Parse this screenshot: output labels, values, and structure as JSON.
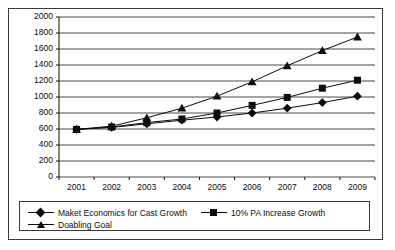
{
  "chart_data": {
    "type": "line",
    "title": "",
    "xlabel": "",
    "ylabel": "",
    "categories": [
      "2001",
      "2002",
      "2003",
      "2004",
      "2005",
      "2006",
      "2007",
      "2008",
      "2009"
    ],
    "ylim": [
      0,
      2000
    ],
    "ytick_step": 200,
    "yticks": [
      "2000",
      "1800",
      "1600",
      "1400",
      "1200",
      "1000",
      "800",
      "600",
      "400",
      "200",
      "0"
    ],
    "grid": true,
    "legend_position": "bottom",
    "series": [
      {
        "name": "Maket Economics for Cast Growth",
        "marker": "diamond",
        "color": "#0d0d0d",
        "values": [
          595,
          620,
          665,
          710,
          750,
          800,
          860,
          930,
          1010
        ]
      },
      {
        "name": "10% PA Increase Growth",
        "marker": "square",
        "color": "#0d0d0d",
        "values": [
          595,
          625,
          680,
          725,
          800,
          895,
          995,
          1110,
          1210
        ]
      },
      {
        "name": "Doabling Goal",
        "marker": "triangle",
        "color": "#0d0d0d",
        "values": [
          595,
          635,
          740,
          860,
          1010,
          1190,
          1390,
          1580,
          1750
        ]
      }
    ]
  },
  "legend": {
    "entries": [
      {
        "label": "Maket Economics for Cast Growth",
        "marker": "diamond"
      },
      {
        "label": "10% PA Increase Growth",
        "marker": "square"
      },
      {
        "label": "Doabling Goal",
        "marker": "triangle"
      }
    ]
  },
  "colors": {
    "series": "#0d0d0d",
    "axis": "#0d0d0d",
    "grid": "#4a4a4a",
    "frame": "#3a3a3a",
    "background": "#ffffff"
  }
}
